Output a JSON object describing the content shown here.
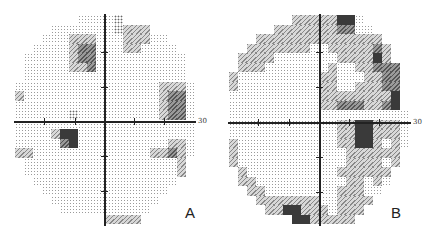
{
  "figure": {
    "panels": [
      {
        "label": "A",
        "axis_label": "30",
        "rows": [
          "00000001111200000000",
          "00001111111233300000",
          "00011133311133311000",
          "00111134411133111100",
          "01111134411111111110",
          "01111133411111111110",
          "01111111111111111110",
          "11111111111111113331",
          "31111111111111113441",
          "11111111111111113441",
          "11111121111111113441",
          "11111111111111111111",
          "11113551111111111111",
          "11111451111111111331",
          "33111111111111133431",
          "01111111111111111130",
          "01111111111111111130",
          "00111111111111111100",
          "00011111111111111000",
          "00001111111111110000",
          "00000111111111100000",
          "00000000003333000000"
        ]
      },
      {
        "label": "B",
        "axis_label": "30",
        "rows": [
          "00000003333355100000",
          "00000333333344110000",
          "00033333333333333000",
          "00333333311333334300",
          "03333111111133335300",
          "03331111111311334440",
          "31111111113311133440",
          "31111111113311333440",
          "11111111113333333350",
          "11111111113344433450",
          "11111111111111111111",
          "11111111111133553331",
          "11111111111133553331",
          "31111111111133553131",
          "31111111111113333330",
          "31111111111113333130",
          "03111111111133333300",
          "03311111111113313100",
          "00331111111133311000",
          "00033333331133330000",
          "00003355333133300000",
          "00000005533333000000"
        ]
      }
    ]
  }
}
